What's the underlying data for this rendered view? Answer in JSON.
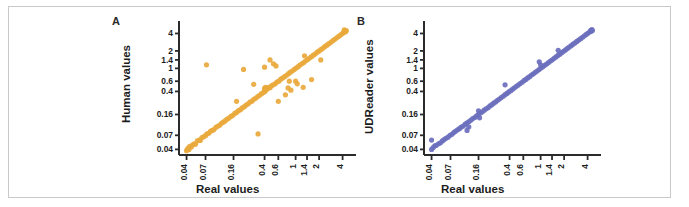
{
  "figure": {
    "background": "#ffffff",
    "border_color": "#c9c9cb"
  },
  "panels": [
    {
      "letter": "A",
      "color": "#e9a93c",
      "ylabel": "Human values",
      "xlabel": "Real values"
    },
    {
      "letter": "B",
      "color": "#6b6fbd",
      "ylabel": "UDReader values",
      "xlabel": "Real values"
    }
  ],
  "chart_data": [
    {
      "type": "scatter",
      "panel": "A",
      "title": "",
      "xlabel": "Real values",
      "ylabel": "Human values",
      "xscale": "log",
      "yscale": "log",
      "xlim": [
        0.032,
        5.6
      ],
      "ylim": [
        0.032,
        5.6
      ],
      "grid": false,
      "legend": null,
      "marker_color": "#e9a93c",
      "xticks": [
        0.04,
        0.07,
        0.16,
        0.4,
        0.6,
        1,
        1.4,
        2,
        4
      ],
      "xtick_labels": [
        "0.04",
        "0.07",
        "0.16",
        "0.4",
        "0.6",
        "1",
        "1.4",
        "2",
        "4"
      ],
      "yticks": [
        0.04,
        0.07,
        0.16,
        0.4,
        0.6,
        1,
        1.4,
        2,
        4
      ],
      "ytick_labels": [
        "0.04",
        "0.07",
        "0.16",
        "0.4",
        "0.6",
        "1",
        "1.4",
        "2",
        "4"
      ],
      "points": [
        [
          0.04,
          0.038
        ],
        [
          0.041,
          0.04
        ],
        [
          0.042,
          0.042
        ],
        [
          0.043,
          0.04
        ],
        [
          0.044,
          0.045
        ],
        [
          0.046,
          0.044
        ],
        [
          0.048,
          0.048
        ],
        [
          0.05,
          0.05
        ],
        [
          0.052,
          0.049
        ],
        [
          0.055,
          0.056
        ],
        [
          0.058,
          0.058
        ],
        [
          0.06,
          0.057
        ],
        [
          0.063,
          0.064
        ],
        [
          0.066,
          0.066
        ],
        [
          0.07,
          0.069
        ],
        [
          0.073,
          0.074
        ],
        [
          0.077,
          0.076
        ],
        [
          0.081,
          0.082
        ],
        [
          0.085,
          0.085
        ],
        [
          0.09,
          0.088
        ],
        [
          0.095,
          0.096
        ],
        [
          0.1,
          0.1
        ],
        [
          0.106,
          0.104
        ],
        [
          0.112,
          0.113
        ],
        [
          0.118,
          0.118
        ],
        [
          0.125,
          0.124
        ],
        [
          0.132,
          0.133
        ],
        [
          0.14,
          0.139
        ],
        [
          0.148,
          0.148
        ],
        [
          0.157,
          0.155
        ],
        [
          0.166,
          0.167
        ],
        [
          0.175,
          0.174
        ],
        [
          0.185,
          0.186
        ],
        [
          0.196,
          0.194
        ],
        [
          0.207,
          0.208
        ],
        [
          0.22,
          0.218
        ],
        [
          0.232,
          0.233
        ],
        [
          0.246,
          0.244
        ],
        [
          0.26,
          0.262
        ],
        [
          0.275,
          0.272
        ],
        [
          0.291,
          0.292
        ],
        [
          0.308,
          0.305
        ],
        [
          0.326,
          0.327
        ],
        [
          0.345,
          0.342
        ],
        [
          0.365,
          0.366
        ],
        [
          0.386,
          0.382
        ],
        [
          0.4,
          0.42
        ],
        [
          0.4,
          0.45
        ],
        [
          0.405,
          0.4
        ],
        [
          0.41,
          0.47
        ],
        [
          0.42,
          0.43
        ],
        [
          0.43,
          0.44
        ],
        [
          0.44,
          0.455
        ],
        [
          0.455,
          0.47
        ],
        [
          0.47,
          0.465
        ],
        [
          0.49,
          0.5
        ],
        [
          0.515,
          0.52
        ],
        [
          0.545,
          0.54
        ],
        [
          0.575,
          0.58
        ],
        [
          0.61,
          0.6
        ],
        [
          0.645,
          0.65
        ],
        [
          0.68,
          0.68
        ],
        [
          0.72,
          0.72
        ],
        [
          0.765,
          0.76
        ],
        [
          0.81,
          0.81
        ],
        [
          0.855,
          0.86
        ],
        [
          0.905,
          0.9
        ],
        [
          0.96,
          0.96
        ],
        [
          1.015,
          1.01
        ],
        [
          1.075,
          1.07
        ],
        [
          1.135,
          1.14
        ],
        [
          1.2,
          1.2
        ],
        [
          1.27,
          1.26
        ],
        [
          1.345,
          1.35
        ],
        [
          1.425,
          1.42
        ],
        [
          1.505,
          1.51
        ],
        [
          1.595,
          1.59
        ],
        [
          1.69,
          1.69
        ],
        [
          1.79,
          1.78
        ],
        [
          1.895,
          1.9
        ],
        [
          2.005,
          2.0
        ],
        [
          2.125,
          2.12
        ],
        [
          2.25,
          2.24
        ],
        [
          2.38,
          2.39
        ],
        [
          2.52,
          2.51
        ],
        [
          2.67,
          2.67
        ],
        [
          2.83,
          2.82
        ],
        [
          2.995,
          3.0
        ],
        [
          3.175,
          3.17
        ],
        [
          3.36,
          3.36
        ],
        [
          3.56,
          3.55
        ],
        [
          3.77,
          3.78
        ],
        [
          3.99,
          3.98
        ],
        [
          4.1,
          4.15
        ],
        [
          4.2,
          4.3
        ],
        [
          4.3,
          4.25
        ],
        [
          4.35,
          4.45
        ],
        [
          4.4,
          4.35
        ],
        [
          4.45,
          4.5
        ],
        [
          4.2,
          4.6
        ],
        [
          0.072,
          1.15
        ],
        [
          0.175,
          0.27
        ],
        [
          0.29,
          0.53
        ],
        [
          0.33,
          0.074
        ],
        [
          0.4,
          1.05
        ],
        [
          0.47,
          1.4
        ],
        [
          0.52,
          1.2
        ],
        [
          0.56,
          1.1
        ],
        [
          0.6,
          0.27
        ],
        [
          0.74,
          0.35
        ],
        [
          0.8,
          0.46
        ],
        [
          0.83,
          0.6
        ],
        [
          0.87,
          0.42
        ],
        [
          1.0,
          0.6
        ],
        [
          1.05,
          0.54
        ],
        [
          1.25,
          0.47
        ],
        [
          1.3,
          1.65
        ],
        [
          1.6,
          0.64
        ],
        [
          2.1,
          1.4
        ],
        [
          0.215,
          0.96
        ]
      ]
    },
    {
      "type": "scatter",
      "panel": "B",
      "title": "",
      "xlabel": "Real values",
      "ylabel": "UDReader values",
      "xscale": "log",
      "yscale": "log",
      "xlim": [
        0.032,
        5.6
      ],
      "ylim": [
        0.032,
        5.6
      ],
      "grid": false,
      "legend": null,
      "marker_color": "#6b6fbd",
      "xticks": [
        0.04,
        0.07,
        0.16,
        0.4,
        0.6,
        1,
        1.4,
        2,
        4
      ],
      "xtick_labels": [
        "0.04",
        "0.07",
        "0.16",
        "0.4",
        "0.6",
        "1",
        "1.4",
        "2",
        "4"
      ],
      "yticks": [
        0.04,
        0.07,
        0.16,
        0.4,
        0.6,
        1,
        1.4,
        2,
        4
      ],
      "ytick_labels": [
        "0.04",
        "0.07",
        "0.16",
        "0.4",
        "0.6",
        "1",
        "1.4",
        "2",
        "4"
      ],
      "points": [
        [
          0.04,
          0.04
        ],
        [
          0.04,
          0.058
        ],
        [
          0.042,
          0.043
        ],
        [
          0.044,
          0.046
        ],
        [
          0.046,
          0.047
        ],
        [
          0.049,
          0.05
        ],
        [
          0.052,
          0.052
        ],
        [
          0.055,
          0.056
        ],
        [
          0.058,
          0.059
        ],
        [
          0.061,
          0.062
        ],
        [
          0.065,
          0.065
        ],
        [
          0.069,
          0.07
        ],
        [
          0.073,
          0.073
        ],
        [
          0.077,
          0.078
        ],
        [
          0.081,
          0.082
        ],
        [
          0.086,
          0.087
        ],
        [
          0.091,
          0.091
        ],
        [
          0.096,
          0.097
        ],
        [
          0.102,
          0.101
        ],
        [
          0.108,
          0.109
        ],
        [
          0.114,
          0.085
        ],
        [
          0.114,
          0.115
        ],
        [
          0.12,
          0.098
        ],
        [
          0.121,
          0.121
        ],
        [
          0.128,
          0.128
        ],
        [
          0.135,
          0.136
        ],
        [
          0.143,
          0.142
        ],
        [
          0.151,
          0.152
        ],
        [
          0.16,
          0.16
        ],
        [
          0.16,
          0.185
        ],
        [
          0.165,
          0.14
        ],
        [
          0.169,
          0.17
        ],
        [
          0.179,
          0.178
        ],
        [
          0.189,
          0.19
        ],
        [
          0.2,
          0.2
        ],
        [
          0.212,
          0.21
        ],
        [
          0.224,
          0.225
        ],
        [
          0.237,
          0.236
        ],
        [
          0.25,
          0.251
        ],
        [
          0.265,
          0.264
        ],
        [
          0.28,
          0.281
        ],
        [
          0.296,
          0.295
        ],
        [
          0.313,
          0.314
        ],
        [
          0.331,
          0.33
        ],
        [
          0.35,
          0.351
        ],
        [
          0.35,
          0.52
        ],
        [
          0.37,
          0.369
        ],
        [
          0.391,
          0.392
        ],
        [
          0.414,
          0.412
        ],
        [
          0.437,
          0.438
        ],
        [
          0.462,
          0.461
        ],
        [
          0.489,
          0.49
        ],
        [
          0.517,
          0.515
        ],
        [
          0.546,
          0.548
        ],
        [
          0.578,
          0.576
        ],
        [
          0.611,
          0.612
        ],
        [
          0.646,
          0.645
        ],
        [
          0.683,
          0.684
        ],
        [
          0.722,
          0.72
        ],
        [
          0.763,
          0.765
        ],
        [
          0.807,
          0.805
        ],
        [
          0.853,
          0.855
        ],
        [
          0.902,
          0.9
        ],
        [
          0.954,
          0.955
        ],
        [
          0.96,
          1.3
        ],
        [
          1.009,
          1.01
        ],
        [
          1.0,
          1.15
        ],
        [
          1.067,
          1.065
        ],
        [
          1.128,
          1.13
        ],
        [
          1.192,
          1.19
        ],
        [
          1.261,
          1.26
        ],
        [
          1.333,
          1.335
        ],
        [
          1.41,
          1.405
        ],
        [
          1.491,
          1.495
        ],
        [
          1.576,
          1.575
        ],
        [
          1.667,
          1.67
        ],
        [
          1.68,
          2.05
        ],
        [
          1.762,
          1.76
        ],
        [
          1.864,
          1.865
        ],
        [
          1.97,
          1.97
        ],
        [
          2.084,
          2.08
        ],
        [
          2.203,
          2.205
        ],
        [
          2.33,
          2.33
        ],
        [
          2.463,
          2.46
        ],
        [
          2.605,
          2.61
        ],
        [
          2.754,
          2.75
        ],
        [
          2.912,
          2.915
        ],
        [
          3.079,
          3.08
        ],
        [
          3.255,
          3.25
        ],
        [
          3.442,
          3.445
        ],
        [
          3.639,
          3.64
        ],
        [
          3.847,
          3.85
        ],
        [
          4.067,
          4.07
        ],
        [
          4.3,
          4.3
        ],
        [
          4.4,
          4.55
        ],
        [
          4.5,
          4.4
        ],
        [
          4.55,
          4.65
        ],
        [
          4.6,
          4.5
        ]
      ]
    }
  ]
}
